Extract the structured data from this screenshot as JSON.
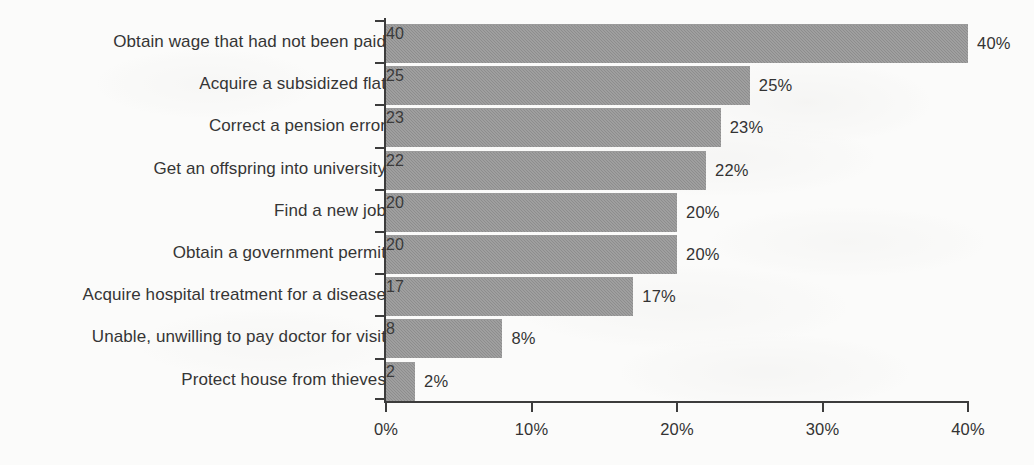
{
  "chart_data": {
    "type": "bar",
    "orientation": "horizontal",
    "title": "",
    "subtitle": "",
    "xlabel": "",
    "ylabel": "",
    "xlim": [
      0,
      40
    ],
    "grid": false,
    "legend": null,
    "value_suffix": "%",
    "categories": [
      "Obtain wage that had not been paid",
      "Acquire a subsidized flat",
      "Correct a pension error",
      "Get an offspring into university",
      "Find a new job",
      "Obtain a government permit",
      "Acquire hospital treatment for a disease",
      "Unable, unwilling to pay doctor for visit",
      "Protect house from thieves"
    ],
    "values": [
      40,
      25,
      23,
      22,
      20,
      20,
      17,
      8,
      2
    ],
    "value_labels": [
      "40%",
      "25%",
      "23%",
      "22%",
      "20%",
      "20%",
      "17%",
      "8%",
      "2%"
    ],
    "xticks": [
      0,
      10,
      20,
      30,
      40
    ],
    "xtick_labels": [
      "0%",
      "10%",
      "20%",
      "30%",
      "40%"
    ],
    "colors": {
      "bar_fill": "#8d8d8d",
      "axis": "#3c3c3c",
      "text": "#333333",
      "background": "#fbfbfa"
    }
  }
}
